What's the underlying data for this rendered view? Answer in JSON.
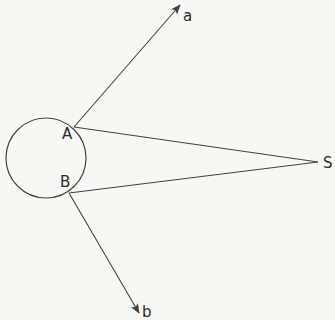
{
  "diagram": {
    "labels": {
      "a": "a",
      "b": "b",
      "A": "A",
      "B": "B",
      "S": "S"
    },
    "colors": {
      "stroke": "#444444",
      "background": "#f7f7f5"
    },
    "circle": {
      "cx": 46,
      "cy": 158,
      "r": 40
    },
    "points": {
      "A": {
        "x": 74,
        "y": 127
      },
      "B": {
        "x": 69,
        "y": 193
      },
      "S": {
        "x": 318,
        "y": 162
      },
      "a_tip": {
        "x": 180,
        "y": 5
      },
      "b_tip": {
        "x": 139,
        "y": 313
      }
    },
    "segments": [
      {
        "from": "A",
        "to": "S",
        "type": "line"
      },
      {
        "from": "B",
        "to": "S",
        "type": "line"
      },
      {
        "from": "A",
        "to": "a_tip",
        "type": "arrow"
      },
      {
        "from": "B",
        "to": "b_tip",
        "type": "arrow"
      }
    ]
  }
}
